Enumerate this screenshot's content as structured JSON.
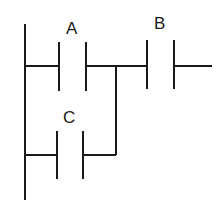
{
  "diagram": {
    "type": "ladder-logic",
    "contacts": [
      {
        "label": "A",
        "type": "normally-open",
        "rung": 1
      },
      {
        "label": "B",
        "type": "normally-open",
        "rung": 1
      },
      {
        "label": "C",
        "type": "normally-open",
        "rung": 2,
        "parallel_with": "A"
      }
    ],
    "colors": {
      "line": "#1a1a1a",
      "background": "#ffffff"
    }
  }
}
